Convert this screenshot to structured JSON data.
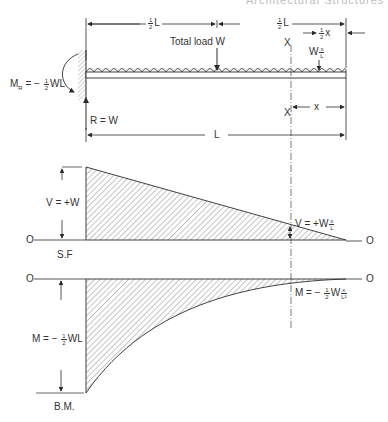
{
  "header": {
    "running_title": "Architectural Structures"
  },
  "beam": {
    "type": "cantilever",
    "load": "uniformly distributed",
    "labels": {
      "half_span_left": "½ L",
      "half_span_right": "½ L",
      "half_x": "½ x",
      "total_load": "Total load W",
      "section_load": "W x/L",
      "section_top": "X",
      "section_bottom": "X",
      "x_dim": "x",
      "span": "L",
      "reaction": "R = W",
      "moment_reaction_main": "M",
      "moment_reaction_sub": "R",
      "moment_reaction_value": "= − ½ WL"
    }
  },
  "shear_diagram": {
    "caption": "S.F",
    "zero_left": "O",
    "zero_right": "O",
    "max_label": "V = +W",
    "section_label": "V = +W x/L"
  },
  "moment_diagram": {
    "caption": "B.M.",
    "zero_left": "O",
    "zero_right": "O",
    "max_label": "M = − ½ WL",
    "section_label": "M = − ½ W x²/L"
  },
  "colors": {
    "ink": "#2b2b2b",
    "hatch": "#555555",
    "background": "#ffffff"
  }
}
